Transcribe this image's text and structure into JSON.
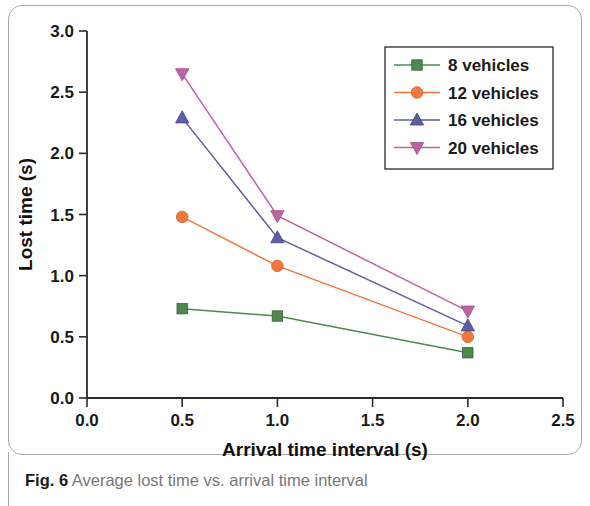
{
  "figure": {
    "caption_prefix": "Fig. 6",
    "caption_text": "Average lost time vs. arrival time interval"
  },
  "chart_data": {
    "type": "line",
    "title": "",
    "xlabel": "Arrival time interval (s)",
    "ylabel": "Lost time (s)",
    "xlim": [
      0.0,
      2.5
    ],
    "ylim": [
      0.0,
      3.0
    ],
    "xticks": [
      "0.0",
      "0.5",
      "1.0",
      "1.5",
      "2.0",
      "2.5"
    ],
    "xtick_values": [
      0.0,
      0.5,
      1.0,
      1.5,
      2.0,
      2.5
    ],
    "yticks": [
      "0.0",
      "0.5",
      "1.0",
      "1.5",
      "2.0",
      "2.5",
      "3.0"
    ],
    "ytick_values": [
      0.0,
      0.5,
      1.0,
      1.5,
      2.0,
      2.5,
      3.0
    ],
    "grid": false,
    "legend_position": "top-right",
    "x": [
      0.5,
      1.0,
      2.0
    ],
    "series": [
      {
        "name": "8 vehicles",
        "values": [
          0.73,
          0.67,
          0.37
        ],
        "color": "#4e8a4e",
        "marker": "square"
      },
      {
        "name": "12 vehicles",
        "values": [
          1.48,
          1.08,
          0.5
        ],
        "color": "#f2773c",
        "marker": "circle"
      },
      {
        "name": "16 vehicles",
        "values": [
          2.29,
          1.31,
          0.59
        ],
        "color": "#5d5da8",
        "marker": "triangle-up"
      },
      {
        "name": "20 vehicles",
        "values": [
          2.65,
          1.49,
          0.71
        ],
        "color": "#c062a4",
        "marker": "triangle-down"
      }
    ]
  }
}
